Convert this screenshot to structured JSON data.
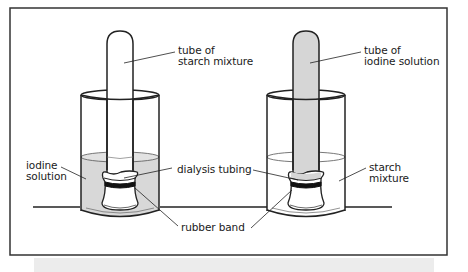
{
  "diagram": {
    "type": "experiment-setup",
    "colors": {
      "frame": "#333333",
      "outline": "#222222",
      "iodine_fill": "#d6d6d6",
      "starch_fill": "#ffffff",
      "rubber_band": "#111111",
      "background": "#ffffff"
    },
    "setups": [
      {
        "id": "left",
        "inner_tube_content": "starch mixture",
        "beaker_content": "iodine solution"
      },
      {
        "id": "right",
        "inner_tube_content": "iodine solution",
        "beaker_content": "starch mixture"
      }
    ],
    "labels": {
      "tube_left": [
        "tube of",
        "starch mixture"
      ],
      "tube_right": [
        "tube of",
        "iodine solution"
      ],
      "beaker_left": [
        "iodine",
        "solution"
      ],
      "beaker_right": [
        "starch",
        "mixture"
      ],
      "dialysis": "dialysis tubing",
      "band": "rubber band"
    }
  }
}
